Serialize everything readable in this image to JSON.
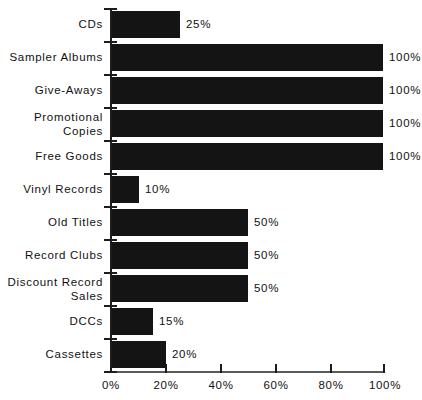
{
  "chart_data": {
    "type": "bar",
    "orientation": "horizontal",
    "title": "",
    "subtitle": "",
    "xlabel": "",
    "ylabel": "",
    "xlim": [
      0,
      100
    ],
    "grid": false,
    "legend": null,
    "x_tick_labels": [
      "0%",
      "20%",
      "40%",
      "60%",
      "80%",
      "100%"
    ],
    "x_tick_values": [
      0,
      20,
      40,
      60,
      80,
      100
    ],
    "categories": [
      "CDs",
      "Sampler  Albums",
      "Give-Aways",
      "Promotional\nCopies",
      "Free Goods",
      "Vinyl  Records",
      "Old  Titles",
      "Record Clubs",
      "Discount  Record\nSales",
      "DCCs",
      "Cassettes"
    ],
    "values": [
      25,
      100,
      100,
      100,
      100,
      10,
      50,
      50,
      50,
      15,
      20
    ],
    "data_labels": [
      "25%",
      "100%",
      "100%",
      "100%",
      "100%",
      "10%",
      "50%",
      "50%",
      "50%",
      "15%",
      "20%"
    ],
    "bar_color": "#141414",
    "axis_color": "#1c1c1c",
    "background_color": "#ffffff"
  }
}
